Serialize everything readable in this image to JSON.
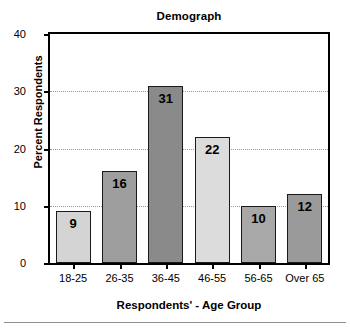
{
  "chart_data": {
    "type": "bar",
    "title": "Demograph",
    "xlabel": "Respondents' - Age Group",
    "ylabel": "Percent Respondents",
    "categories": [
      "18-25",
      "26-35",
      "36-45",
      "46-55",
      "56-65",
      "Over 65"
    ],
    "values": [
      9,
      16,
      31,
      22,
      10,
      12
    ],
    "value_labels": [
      "9",
      "16",
      "31",
      "22",
      "10",
      "12"
    ],
    "bar_colors": [
      "#d4d4d4",
      "#9e9e9e",
      "#8a8a8a",
      "#dcdcdc",
      "#a8a8a8",
      "#9a9a9a"
    ],
    "bar_border_color": "#1a1a1a",
    "ylim": [
      0,
      40
    ],
    "yticks": [
      0,
      10,
      20,
      30,
      40
    ],
    "ytick_labels": [
      "0",
      "10",
      "20",
      "30",
      "40"
    ],
    "grid": "horizontal-dotted",
    "gridlines_at": [
      10,
      20,
      30
    ],
    "legend": "none",
    "axis_color": "#000000",
    "grid_color": "#9a9a9a",
    "background": "#ffffff"
  }
}
